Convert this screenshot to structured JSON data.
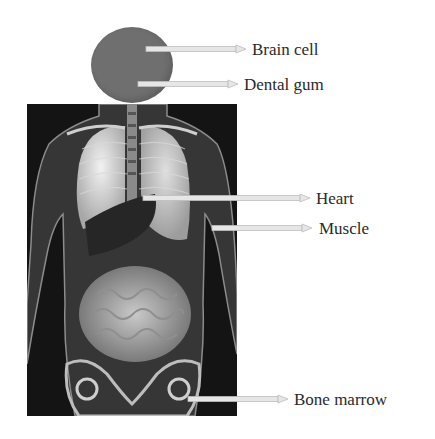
{
  "figure": {
    "head_color": "#6f6f6f",
    "panel_color": "#141414",
    "labels": [
      {
        "id": "brain-cell",
        "text": "Brain cell"
      },
      {
        "id": "dental-gum",
        "text": "Dental gum"
      },
      {
        "id": "heart",
        "text": "Heart"
      },
      {
        "id": "muscle",
        "text": "Muscle"
      },
      {
        "id": "bone-marrow",
        "text": "Bone marrow"
      }
    ]
  }
}
